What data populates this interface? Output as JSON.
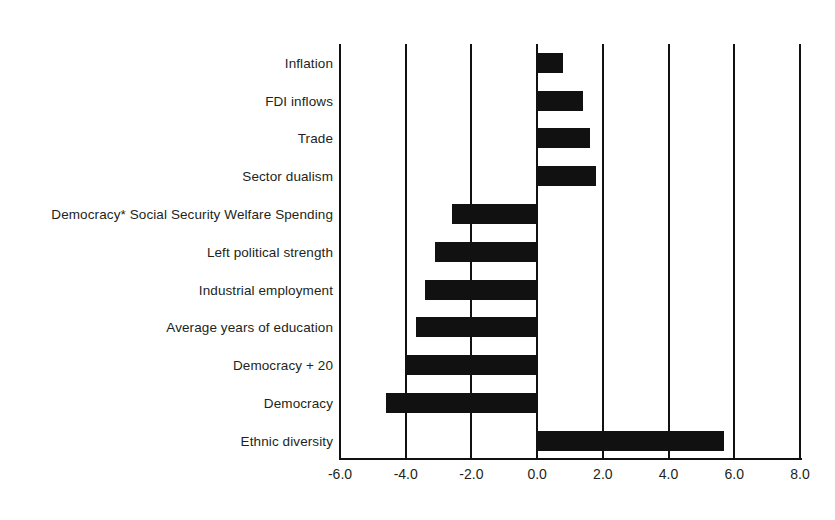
{
  "chart_data": {
    "type": "bar",
    "orientation": "horizontal",
    "title": "",
    "subtitle": "",
    "xlabel": "",
    "ylabel": "",
    "xlim": [
      -6.0,
      8.0
    ],
    "xticks": [
      "-6.0",
      "-4.0",
      "-2.0",
      "0.0",
      "2.0",
      "4.0",
      "6.0",
      "8.0"
    ],
    "xtick_values": [
      -6.0,
      -4.0,
      -2.0,
      0.0,
      2.0,
      4.0,
      6.0,
      8.0
    ],
    "grid": true,
    "grid_axis": "x",
    "legend": false,
    "bar_color": "#111111",
    "categories": [
      "Inflation",
      "FDI inflows",
      "Trade",
      "Sector dualism",
      "Democracy* Social Security Welfare Spending",
      "Left political strength",
      "Industrial employment",
      "Average years of education",
      "Democracy + 20",
      "Democracy",
      "Ethnic diversity"
    ],
    "values": [
      0.8,
      1.4,
      1.6,
      1.8,
      -2.6,
      -3.1,
      -3.4,
      -3.7,
      -4.0,
      -4.6,
      5.7
    ],
    "bars": [
      {
        "label": "Inflation",
        "value": 0.8
      },
      {
        "label": "FDI inflows",
        "value": 1.4
      },
      {
        "label": "Trade",
        "value": 1.6
      },
      {
        "label": "Sector dualism",
        "value": 1.8
      },
      {
        "label": "Democracy* Social Security Welfare Spending",
        "value": -2.6
      },
      {
        "label": "Left political strength",
        "value": -3.1
      },
      {
        "label": "Industrial employment",
        "value": -3.4
      },
      {
        "label": "Average years of education",
        "value": -3.7
      },
      {
        "label": "Democracy + 20",
        "value": -4.0
      },
      {
        "label": "Democracy",
        "value": -4.6
      },
      {
        "label": "Ethnic diversity",
        "value": 5.7
      }
    ]
  }
}
